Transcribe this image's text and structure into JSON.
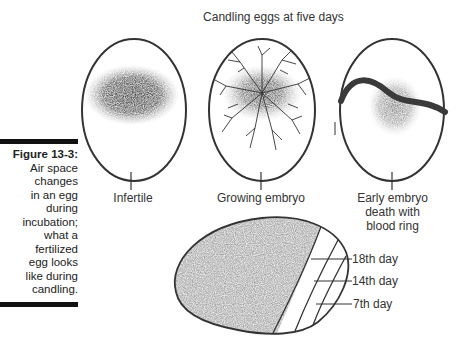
{
  "caption": {
    "figure_label": "Figure 13-3:",
    "text": "Air space changes in an egg during incubation; what a fertilized egg looks like during candling.",
    "lines": [
      "Air space",
      "changes",
      "in an egg",
      "during",
      "incubation;",
      "what a",
      "fertilized",
      "egg looks",
      "like during",
      "candling."
    ]
  },
  "diagram": {
    "title": "Candling eggs at five days",
    "eggs": [
      {
        "label": "Infertile"
      },
      {
        "label": "Growing embryo"
      },
      {
        "label": "Early embryo death with blood ring",
        "lines": [
          "Early embryo",
          "death with",
          "blood ring"
        ]
      }
    ],
    "air_space": {
      "labels": [
        "18th day",
        "14th day",
        "7th day"
      ]
    }
  }
}
